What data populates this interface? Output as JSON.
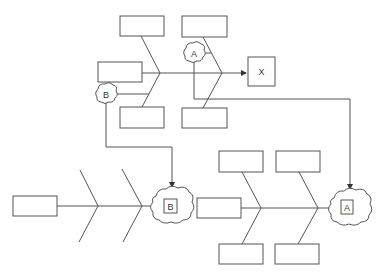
{
  "diagram": {
    "type": "fishbone-linked",
    "top_fishbone": {
      "effect_label": "X",
      "cause_boxes": 5,
      "branch_annotations": [
        "A",
        "B"
      ]
    },
    "bottom_left_fishbone": {
      "effect_label": "B",
      "cause_boxes": 1
    },
    "bottom_right_fishbone": {
      "effect_label": "A",
      "cause_boxes": 5
    },
    "connectors": [
      {
        "from": "A",
        "to": "A"
      },
      {
        "from": "B",
        "to": "B"
      }
    ]
  },
  "labels": {
    "x": "X",
    "a_top": "A",
    "b_top": "B",
    "b_bottom": "B",
    "a_bottom": "A"
  },
  "colors": {
    "stroke": "#555555",
    "background": "#ffffff"
  }
}
